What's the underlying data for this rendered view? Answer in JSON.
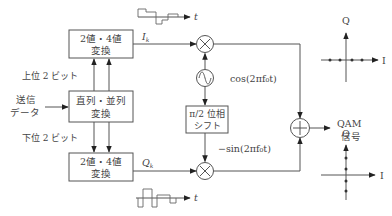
{
  "diagram": {
    "type": "block-diagram",
    "blocks": {
      "conv_top": {
        "line1": "2値・4値",
        "line2": "変換"
      },
      "serial_parallel": {
        "line1": "直列・並列",
        "line2": "変換"
      },
      "conv_bottom": {
        "line1": "2値・4値",
        "line2": "変換"
      },
      "phase_shift": {
        "line1": "π/2 位相",
        "line2": "シフト"
      }
    },
    "labels": {
      "input_line1": "送信",
      "input_line2": "データ",
      "upper_bits": "上位 2 ビット",
      "lower_bits": "下位 2 ビット",
      "i_signal": "I",
      "i_sub": "k",
      "q_signal": "Q",
      "q_sub": "k",
      "cos_carrier": "cos(2πf₀t)",
      "neg_sin_carrier": "−sin(2πf₀t)",
      "output_line1": "QAM",
      "output_line2": "信号",
      "time_axis": "t"
    },
    "symbols": {
      "multiplier": "×",
      "adder": "+",
      "oscillator": "~"
    },
    "constellations": [
      {
        "name": "I-axis constellation",
        "axis_h": "I",
        "axis_v": "Q",
        "points_on": "I",
        "num_points": 4
      },
      {
        "name": "Q-axis constellation",
        "axis_h": "I",
        "axis_v": "Q",
        "points_on": "Q",
        "num_points": 4
      }
    ],
    "edges": [
      {
        "from": "input",
        "to": "serial_parallel",
        "label": "送信データ"
      },
      {
        "from": "serial_parallel",
        "to": "conv_top",
        "label": "上位 2 ビット",
        "count": 2
      },
      {
        "from": "serial_parallel",
        "to": "conv_bottom",
        "label": "下位 2 ビット",
        "count": 2
      },
      {
        "from": "conv_top",
        "to": "multiplier_top",
        "label": "Ik"
      },
      {
        "from": "conv_bottom",
        "to": "multiplier_bottom",
        "label": "Qk"
      },
      {
        "from": "oscillator",
        "to": "multiplier_top",
        "label": "cos(2πf₀t)"
      },
      {
        "from": "oscillator",
        "to": "phase_shift"
      },
      {
        "from": "phase_shift",
        "to": "multiplier_bottom",
        "label": "−sin(2πf₀t)"
      },
      {
        "from": "multiplier_top",
        "to": "adder"
      },
      {
        "from": "multiplier_bottom",
        "to": "adder"
      },
      {
        "from": "adder",
        "to": "output",
        "label": "QAM信号"
      }
    ]
  }
}
